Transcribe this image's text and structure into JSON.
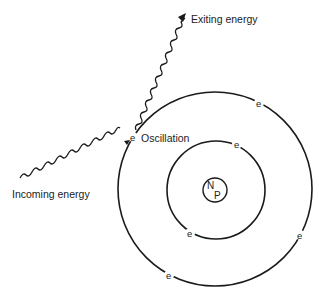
{
  "diagram": {
    "title": "",
    "labels": {
      "exiting": "Exiting energy",
      "incoming": "Incoming energy",
      "oscillation": "Oscillation"
    },
    "nucleus": {
      "label_top": "N",
      "label_bottom": "P",
      "cx": 215,
      "cy": 190,
      "r": 12
    },
    "orbits": [
      {
        "name": "inner-orbit",
        "cx": 216,
        "cy": 190,
        "r": 49
      },
      {
        "name": "outer-orbit",
        "cx": 215,
        "cy": 189,
        "r": 97
      }
    ],
    "electrons": [
      {
        "symbol": "e",
        "orbit": "outer-orbit",
        "x": 133,
        "y": 138,
        "note": "oscillating"
      },
      {
        "symbol": "e",
        "orbit": "outer-orbit",
        "x": 259,
        "y": 103
      },
      {
        "symbol": "e",
        "orbit": "outer-orbit",
        "x": 300,
        "y": 235
      },
      {
        "symbol": "e",
        "orbit": "outer-orbit",
        "x": 169,
        "y": 275
      },
      {
        "symbol": "e",
        "orbit": "inner-orbit",
        "x": 237,
        "y": 144
      },
      {
        "symbol": "e",
        "orbit": "inner-orbit",
        "x": 190,
        "y": 233
      }
    ],
    "waves": [
      {
        "name": "incoming-energy-wave",
        "from": [
          20,
          177
        ],
        "to": [
          128,
          142
        ],
        "arrow": true
      },
      {
        "name": "exiting-energy-wave",
        "from": [
          135,
          128
        ],
        "to": [
          185,
          15
        ],
        "arrow": true
      }
    ],
    "colors": {
      "line": "#1a1a1a",
      "text": "#222222",
      "background": "#ffffff"
    }
  }
}
